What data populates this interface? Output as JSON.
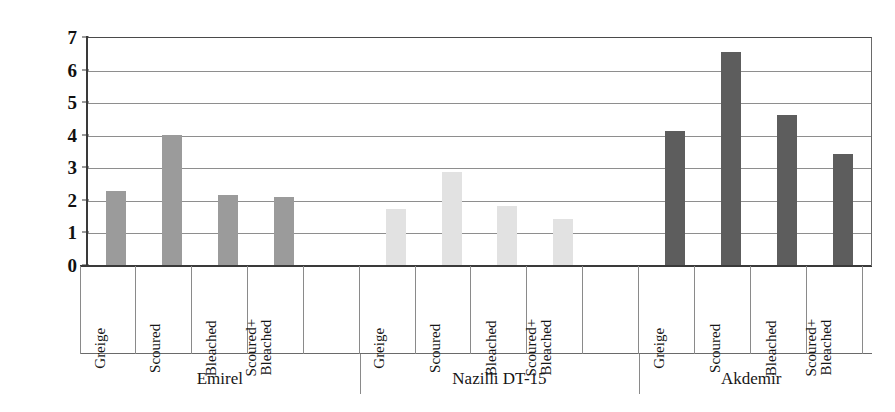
{
  "chart_data": {
    "type": "bar",
    "title": "",
    "xlabel": "",
    "ylabel": "K/S  (Color strength)",
    "ylim": [
      0,
      7
    ],
    "ytick_labels": [
      "0",
      "1",
      "2",
      "3",
      "4",
      "5",
      "6",
      "7"
    ],
    "grid": true,
    "legend": "none",
    "categories": [
      "Greige",
      "Scoured",
      "Bleached",
      "Scoured+\nBleached"
    ],
    "groups": [
      {
        "name": "Emirel",
        "color": "#9b9b9b",
        "values": [
          2.27,
          4.0,
          2.15,
          2.08
        ]
      },
      {
        "name": "Nazilli DT-15",
        "color": "#e2e2e2",
        "values": [
          1.72,
          2.85,
          1.8,
          1.42
        ]
      },
      {
        "name": "Akdemir",
        "color": "#5d5d5d",
        "values": [
          4.1,
          6.55,
          4.6,
          3.4
        ]
      }
    ]
  }
}
